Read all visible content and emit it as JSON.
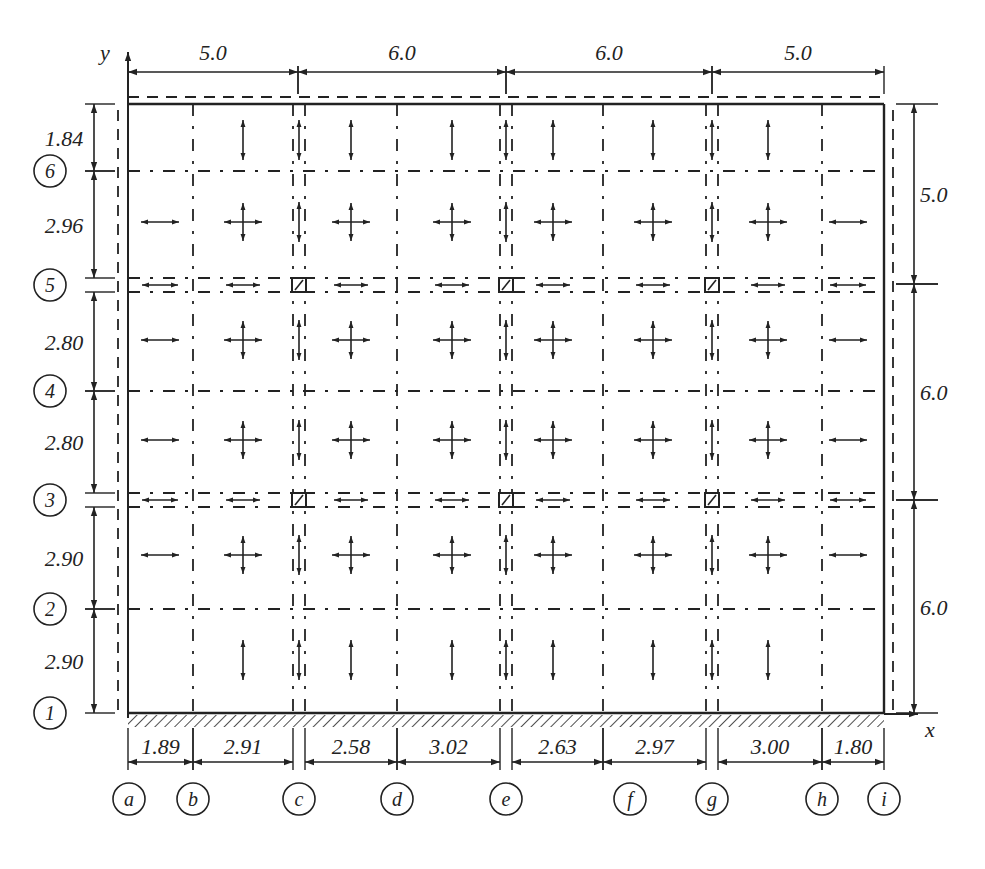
{
  "figure": {
    "type": "structural floor plan / slab grid with support conditions",
    "axes": {
      "x_label": "x",
      "y_label": "y"
    },
    "top_dimensions": [
      {
        "value": "5.0",
        "from": 128,
        "to": 298
      },
      {
        "value": "6.0",
        "from": 298,
        "to": 506
      },
      {
        "value": "6.0",
        "from": 506,
        "to": 712
      },
      {
        "value": "5.0",
        "from": 712,
        "to": 884
      }
    ],
    "right_dimensions": [
      {
        "value": "5.0",
        "from": 104,
        "to": 284
      },
      {
        "value": "6.0",
        "from": 284,
        "to": 500
      },
      {
        "value": "6.0",
        "from": 500,
        "to": 713
      }
    ],
    "left_dimensions": [
      {
        "value": "1.84",
        "from": 104,
        "to": 171
      },
      {
        "value": "2.96",
        "from": 171,
        "to": 278
      },
      {
        "value": "2.80",
        "from": 292,
        "to": 391
      },
      {
        "value": "2.80",
        "from": 391,
        "to": 493
      },
      {
        "value": "2.90",
        "from": 507,
        "to": 609
      },
      {
        "value": "2.90",
        "from": 609,
        "to": 713
      }
    ],
    "bottom_dimensions": [
      {
        "value": "1.89",
        "from": 128,
        "to": 193
      },
      {
        "value": "2.91",
        "from": 193,
        "to": 293
      },
      {
        "value": "2.58",
        "from": 305,
        "to": 397
      },
      {
        "value": "3.02",
        "from": 397,
        "to": 500
      },
      {
        "value": "2.63",
        "from": 512,
        "to": 603
      },
      {
        "value": "2.97",
        "from": 603,
        "to": 706
      },
      {
        "value": "3.00",
        "from": 718,
        "to": 822
      },
      {
        "value": "1.80",
        "from": 822,
        "to": 884
      }
    ],
    "row_axes": [
      {
        "label": "6",
        "y": 171
      },
      {
        "label": "5",
        "y": 285
      },
      {
        "label": "4",
        "y": 391
      },
      {
        "label": "3",
        "y": 500
      },
      {
        "label": "2",
        "y": 609
      },
      {
        "label": "1",
        "y": 713
      }
    ],
    "column_axes": [
      {
        "label": "a",
        "x": 128
      },
      {
        "label": "b",
        "x": 193
      },
      {
        "label": "c",
        "x": 299
      },
      {
        "label": "d",
        "x": 397
      },
      {
        "label": "e",
        "x": 506
      },
      {
        "label": "f",
        "x": 603
      },
      {
        "label": "g",
        "x": 712
      },
      {
        "label": "h",
        "x": 822
      },
      {
        "label": "i",
        "x": 884
      }
    ],
    "columns_hatched": [
      {
        "x": 299,
        "y": 285
      },
      {
        "x": 506,
        "y": 285
      },
      {
        "x": 712,
        "y": 285
      },
      {
        "x": 299,
        "y": 500
      },
      {
        "x": 506,
        "y": 500
      },
      {
        "x": 712,
        "y": 500
      }
    ],
    "colors": {
      "ink": "#222222",
      "background": "#ffffff"
    }
  }
}
